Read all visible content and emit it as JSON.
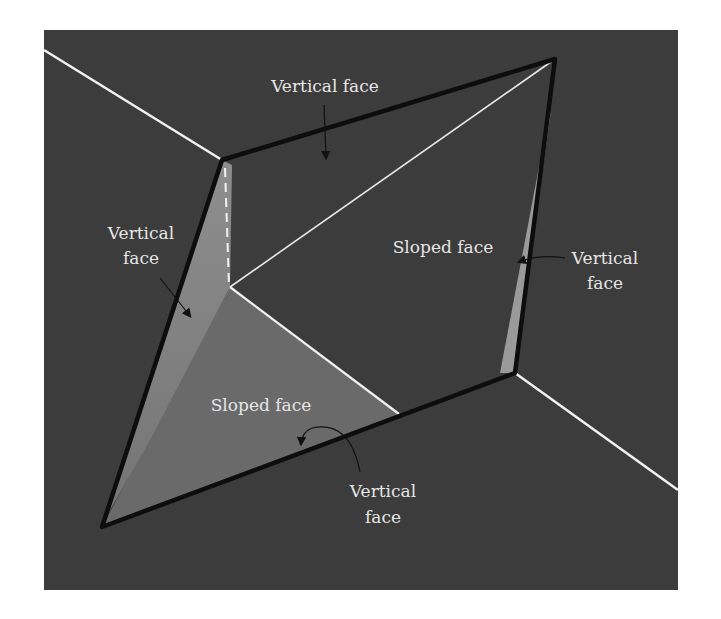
{
  "figure": {
    "colors": {
      "page_background": "#ffffff",
      "frame_background": "#3c3c3c",
      "sloped_face_fill": "#6a6a6a",
      "vertical_face_fill": "#8c8c8c",
      "right_strip_fill": "#9a9a9a",
      "boundary_line": "#0d0d0d",
      "white_line": "#f2f2f2",
      "label_text": "#e6e6e6",
      "arrow": "#111111"
    },
    "labels": {
      "top_vertical": "Vertical face",
      "left_vertical_line1": "Vertical",
      "left_vertical_line2": "face",
      "right_sloped": "Sloped face",
      "right_vertical_line1": "Vertical",
      "right_vertical_line2": "face",
      "bottom_sloped": "Sloped face",
      "bottom_vertical_line1": "Vertical",
      "bottom_vertical_line2": "face"
    }
  }
}
